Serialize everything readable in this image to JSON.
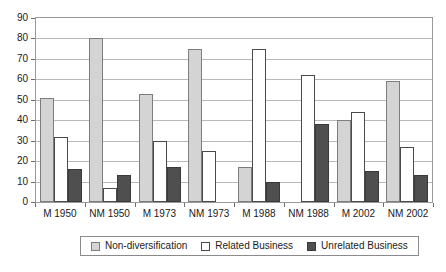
{
  "chart_data": {
    "type": "bar",
    "title": "",
    "subtitle": "",
    "xlabel": "",
    "ylabel": "",
    "ylim": [
      0,
      90
    ],
    "ytick_step": 10,
    "yticks": [
      0,
      10,
      20,
      30,
      40,
      50,
      60,
      70,
      80,
      90
    ],
    "grid": true,
    "grid_axis": "y",
    "legend_position": "bottom",
    "categories": [
      "M 1950",
      "NM 1950",
      "M 1973",
      "NM 1973",
      "M 1988",
      "NM 1988",
      "M 2002",
      "NM 2002"
    ],
    "series": [
      {
        "name": "Non-diversification",
        "color": "#d4d4d4",
        "values": [
          51,
          80,
          53,
          75,
          17,
          0,
          40,
          59
        ]
      },
      {
        "name": "Related Business",
        "color": "#ffffff",
        "values": [
          32,
          7,
          30,
          25,
          75,
          62,
          44,
          27
        ]
      },
      {
        "name": "Unrelated Business",
        "color": "#4f4f4f",
        "values": [
          16,
          13,
          17,
          0,
          10,
          38,
          15,
          13
        ]
      }
    ]
  },
  "legend": {
    "entries": [
      {
        "label": "Non-diversification"
      },
      {
        "label": "Related Business"
      },
      {
        "label": "Unrelated Business"
      }
    ]
  }
}
